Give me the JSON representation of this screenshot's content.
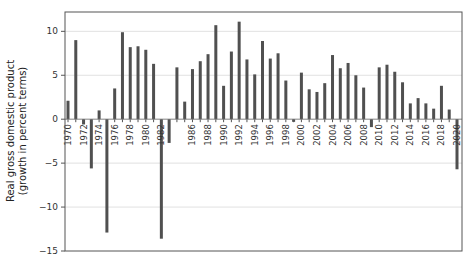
{
  "chart_data": {
    "type": "bar",
    "title": "",
    "xlabel": "",
    "ylabel_lines": [
      "Real gross domestic product",
      "(growth in percent terms)"
    ],
    "ylim": [
      -15,
      12.2
    ],
    "yticks": [
      10,
      5,
      0,
      -5,
      -10,
      -15
    ],
    "ytick_labels": [
      "10",
      "5",
      "0",
      "−5",
      "−10",
      "−15"
    ],
    "grid": true,
    "legend": "none",
    "categories": [
      1970,
      1971,
      1972,
      1973,
      1974,
      1975,
      1976,
      1977,
      1978,
      1979,
      1980,
      1981,
      1982,
      1983,
      1984,
      1985,
      1986,
      1987,
      1988,
      1989,
      1990,
      1991,
      1992,
      1993,
      1994,
      1995,
      1996,
      1997,
      1998,
      1999,
      2000,
      2001,
      2002,
      2003,
      2004,
      2005,
      2006,
      2007,
      2008,
      2009,
      2010,
      2011,
      2012,
      2013,
      2014,
      2015,
      2016,
      2017,
      2018,
      2019,
      2020
    ],
    "values": [
      2.1,
      9.0,
      -0.6,
      -5.6,
      1.0,
      -12.9,
      3.5,
      9.9,
      8.2,
      8.3,
      7.9,
      6.3,
      -13.6,
      -2.7,
      5.9,
      2.0,
      5.7,
      6.6,
      7.4,
      10.7,
      3.8,
      7.7,
      11.1,
      6.8,
      5.1,
      8.9,
      6.9,
      7.5,
      4.4,
      -0.3,
      5.3,
      3.4,
      3.1,
      4.1,
      7.3,
      5.8,
      6.4,
      5.0,
      3.6,
      -0.9,
      5.9,
      6.2,
      5.4,
      4.2,
      1.8,
      2.4,
      1.8,
      1.2,
      3.8,
      1.1,
      -5.7
    ],
    "xtick_labels": [
      "1970",
      "1972",
      "1974",
      "1976",
      "1978",
      "1980",
      "1982",
      "1986",
      "1988",
      "1990",
      "1992",
      "1994",
      "1996",
      "1998",
      "2000",
      "2002",
      "2004",
      "2006",
      "2008",
      "2010",
      "2012",
      "2014",
      "2016",
      "2018",
      "2020"
    ],
    "xtick_years": [
      1970,
      1972,
      1974,
      1976,
      1978,
      1980,
      1982,
      1986,
      1988,
      1990,
      1992,
      1994,
      1996,
      1998,
      2000,
      2002,
      2004,
      2006,
      2008,
      2010,
      2012,
      2014,
      2016,
      2018,
      2020
    ],
    "bar_color": "#505050"
  }
}
